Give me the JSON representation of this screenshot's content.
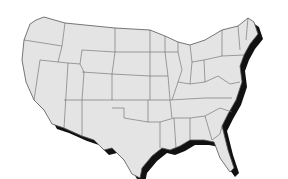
{
  "map": {
    "subject": "Contiguous United States outline with state borders",
    "style": "grayscale with black drop shadow",
    "colors": {
      "background": "#ffffff",
      "land": "#e4e4e4",
      "borders": "#555555",
      "shadow": "#111111"
    },
    "labels": []
  }
}
